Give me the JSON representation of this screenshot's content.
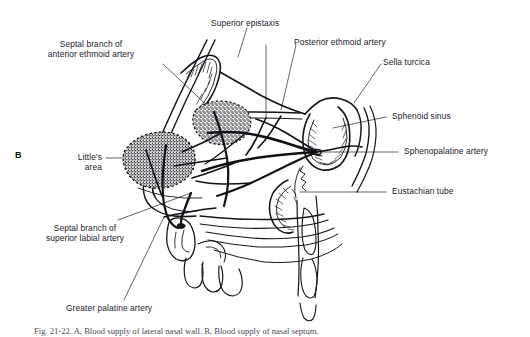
{
  "figure": {
    "panel_marker": "B",
    "caption": "Fig. 21-22. A, Blood supply of lateral nasal wall. B, Blood supply of nasal septum.",
    "title_description": "Sagittal section of nasal septum showing arterial blood supply",
    "ink_color": "#111118",
    "leader_color": "#30303a",
    "background_color": "#ffffff"
  },
  "labels": {
    "superior_epistaxis": "Superior epistaxis",
    "septal_branch_anterior_ethmoid": "Septal branch of\nanterior ethmoid artery",
    "septal_branch_anterior_ethmoid_line1": "Septal branch of",
    "septal_branch_anterior_ethmoid_line2": "anterior ethmoid artery",
    "posterior_ethmoid_artery": "Posterior ethmoid artery",
    "sella_turcica": "Sella turcica",
    "sphenoid_sinus": "Sphenoid sinus",
    "sphenopalatine_artery": "Sphenopalatine artery",
    "eustachian_tube": "Eustachian tube",
    "littles_area_line1": "Little's",
    "littles_area_line2": "area",
    "septal_branch_superior_labial_line1": "Septal branch of",
    "septal_branch_superior_labial_line2": "superior labial artery",
    "greater_palatine_artery": "Greater palatine artery"
  }
}
